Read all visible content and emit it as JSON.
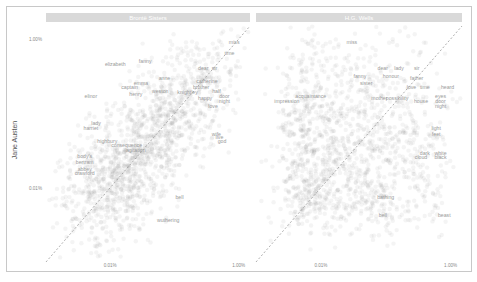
{
  "chart_data": {
    "type": "scatter",
    "title": "",
    "ylabel": "Jane Austen",
    "xlabel": "",
    "scale": "log10",
    "axis_range_proportion": [
      1e-05,
      0.015
    ],
    "x_ticks": [
      "0.01%",
      "1.00%"
    ],
    "x_tick_values": [
      0.0001,
      0.01
    ],
    "y_ticks": [
      "1.00%",
      "0.01%"
    ],
    "y_tick_values": [
      0.01,
      0.0001
    ],
    "reference_line": "y = x (dashed)",
    "panels": [
      {
        "name": "Brontë Sisters",
        "labeled_words": [
          {
            "word": "miss",
            "x": 0.0085,
            "y": 0.0085
          },
          {
            "word": "time",
            "x": 0.0072,
            "y": 0.0062
          },
          {
            "word": "elizabeth",
            "x": 0.00012,
            "y": 0.0044
          },
          {
            "word": "fanny",
            "x": 0.00035,
            "y": 0.0048
          },
          {
            "word": "dear",
            "x": 0.0028,
            "y": 0.0038
          },
          {
            "word": "sir",
            "x": 0.0042,
            "y": 0.0038
          },
          {
            "word": "catherine",
            "x": 0.0032,
            "y": 0.0026
          },
          {
            "word": "anne",
            "x": 0.0007,
            "y": 0.0028
          },
          {
            "word": "emma",
            "x": 0.0003,
            "y": 0.0024
          },
          {
            "word": "captain",
            "x": 0.0002,
            "y": 0.0021
          },
          {
            "word": "weston",
            "x": 0.0006,
            "y": 0.0019
          },
          {
            "word": "brother",
            "x": 0.0026,
            "y": 0.0021
          },
          {
            "word": "half",
            "x": 0.0045,
            "y": 0.0019
          },
          {
            "word": "knightley",
            "x": 0.0016,
            "y": 0.0018
          },
          {
            "word": "henry",
            "x": 0.00025,
            "y": 0.0017
          },
          {
            "word": "elinor",
            "x": 5e-05,
            "y": 0.0016
          },
          {
            "word": "door",
            "x": 0.006,
            "y": 0.0016
          },
          {
            "word": "night",
            "x": 0.006,
            "y": 0.0014
          },
          {
            "word": "happy",
            "x": 0.003,
            "y": 0.0015
          },
          {
            "word": "lady",
            "x": 6e-05,
            "y": 0.0007
          },
          {
            "word": "harriet",
            "x": 5e-05,
            "y": 0.0006
          },
          {
            "word": "body's",
            "x": 4e-05,
            "y": 0.00025
          },
          {
            "word": "bertram",
            "x": 4e-05,
            "y": 0.00021
          },
          {
            "word": "abbey",
            "x": 4e-05,
            "y": 0.00017
          },
          {
            "word": "crawford",
            "x": 4e-05,
            "y": 0.00015
          },
          {
            "word": "highbury",
            "x": 9e-05,
            "y": 0.0004
          },
          {
            "word": "agitation",
            "x": 0.00025,
            "y": 0.0003
          },
          {
            "word": "consequence",
            "x": 0.00018,
            "y": 0.00035
          },
          {
            "word": "wife",
            "x": 0.0045,
            "y": 0.0005
          },
          {
            "word": "live",
            "x": 0.005,
            "y": 0.00045
          },
          {
            "word": "god",
            "x": 0.0055,
            "y": 0.0004
          },
          {
            "word": "love",
            "x": 0.004,
            "y": 0.0012
          },
          {
            "word": "bell",
            "x": 0.0012,
            "y": 7e-05
          },
          {
            "word": "wuthering",
            "x": 0.0008,
            "y": 3.5e-05
          }
        ]
      },
      {
        "name": "H.G. Wells",
        "labeled_words": [
          {
            "word": "miss",
            "x": 0.0003,
            "y": 0.0085
          },
          {
            "word": "dear",
            "x": 0.0009,
            "y": 0.0038
          },
          {
            "word": "lady",
            "x": 0.0016,
            "y": 0.0038
          },
          {
            "word": "sir",
            "x": 0.003,
            "y": 0.0038
          },
          {
            "word": "fanny",
            "x": 0.0004,
            "y": 0.003
          },
          {
            "word": "honour",
            "x": 0.0012,
            "y": 0.003
          },
          {
            "word": "father",
            "x": 0.003,
            "y": 0.0028
          },
          {
            "word": "sister",
            "x": 0.0005,
            "y": 0.0024
          },
          {
            "word": "love",
            "x": 0.0025,
            "y": 0.0021
          },
          {
            "word": "time",
            "x": 0.004,
            "y": 0.0021
          },
          {
            "word": "heard",
            "x": 0.009,
            "y": 0.0021
          },
          {
            "word": "acquaintance",
            "x": 7e-05,
            "y": 0.0016
          },
          {
            "word": "impression",
            "x": 3e-05,
            "y": 0.0014
          },
          {
            "word": "mother",
            "x": 0.0008,
            "y": 0.0015
          },
          {
            "word": "possibility",
            "x": 0.0015,
            "y": 0.0015
          },
          {
            "word": "house",
            "x": 0.0035,
            "y": 0.0014
          },
          {
            "word": "eyes",
            "x": 0.007,
            "y": 0.0016
          },
          {
            "word": "door",
            "x": 0.007,
            "y": 0.0014
          },
          {
            "word": "night",
            "x": 0.007,
            "y": 0.0012
          },
          {
            "word": "light",
            "x": 0.006,
            "y": 0.0006
          },
          {
            "word": "feet",
            "x": 0.006,
            "y": 0.0005
          },
          {
            "word": "dark",
            "x": 0.004,
            "y": 0.00028
          },
          {
            "word": "white",
            "x": 0.007,
            "y": 0.00028
          },
          {
            "word": "cloud",
            "x": 0.0035,
            "y": 0.00024
          },
          {
            "word": "black",
            "x": 0.007,
            "y": 0.00024
          },
          {
            "word": "beast",
            "x": 0.008,
            "y": 4e-05
          },
          {
            "word": "bathing",
            "x": 0.001,
            "y": 7e-05
          },
          {
            "word": "bell",
            "x": 0.0009,
            "y": 4e-05
          }
        ]
      }
    ]
  }
}
